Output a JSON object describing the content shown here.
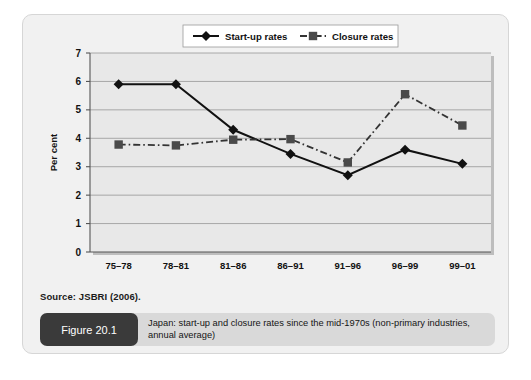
{
  "figure": {
    "tag": "Figure 20.1",
    "caption": "Japan: start-up and closure rates since the mid-1970s (non-primary industries, annual average)",
    "source": "Source: JSBRI (2006)."
  },
  "chart_data": {
    "type": "line",
    "title": "",
    "xlabel": "",
    "ylabel": "Per cent",
    "categories": [
      "75–78",
      "78–81",
      "81–86",
      "86–91",
      "91–96",
      "96–99",
      "99–01"
    ],
    "ylim": [
      0,
      7
    ],
    "yticks": [
      0,
      1,
      2,
      3,
      4,
      5,
      6,
      7
    ],
    "ytick_labels": [
      "0",
      "1",
      "2",
      "3",
      "4",
      "5",
      "6",
      "7"
    ],
    "grid": true,
    "legend_position": "top-center",
    "series": [
      {
        "name": "Start-up rates",
        "marker": "diamond",
        "line_style": "solid",
        "color": "#111111",
        "values": [
          5.9,
          5.9,
          4.3,
          3.45,
          2.7,
          3.6,
          3.1
        ]
      },
      {
        "name": "Closure rates",
        "marker": "square",
        "line_style": "dash-dot",
        "color": "#4a4a4a",
        "values": [
          3.78,
          3.75,
          3.95,
          3.97,
          3.15,
          5.55,
          4.45
        ]
      }
    ]
  },
  "colors": {
    "card_background": "#f1f1f1",
    "plot_background": "#e8e8e8",
    "caption_tag_background": "#3a3a3a",
    "caption_bar_background": "#d9d9d9",
    "gridline": "#8a8a8a"
  }
}
